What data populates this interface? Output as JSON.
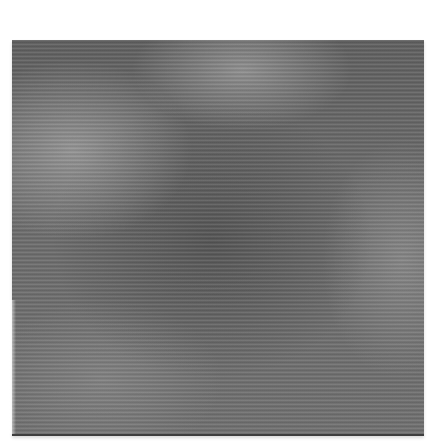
{
  "image": {
    "description": "Grayscale photograph of a square swatch of finely striated fabric/paper texture on white background",
    "subject": "textured-square-swatch",
    "colors": {
      "background": "#ffffff",
      "swatch_mid": "#6b6b6b",
      "swatch_dark": "#3e3e3e",
      "swatch_light": "#c8c8c8"
    }
  }
}
